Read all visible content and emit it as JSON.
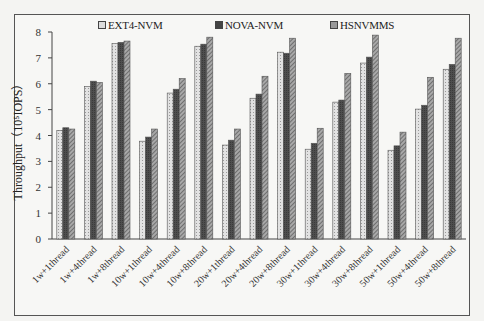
{
  "chart_data": {
    "type": "bar",
    "title": "",
    "xlabel": "",
    "ylabel": "Throughput（10⁵IOPS）",
    "ylim": [
      0,
      8
    ],
    "yticks": [
      0,
      1,
      2,
      3,
      4,
      5,
      6,
      7,
      8
    ],
    "grid": false,
    "legend_position": "top",
    "categories": [
      "1w+1thread",
      "1w+4thread",
      "1w+8thread",
      "10w+1thread",
      "10w+4thread",
      "10w+8thread",
      "20w+1thread",
      "20w+4thread",
      "20w+8thread",
      "30w+1thread",
      "30w+4thread",
      "30w+8thread",
      "50w+1thread",
      "50w+4thread",
      "50w+8thread"
    ],
    "series": [
      {
        "name": "EXT4-NVM",
        "color": "#d8d8d8",
        "values": [
          4.2,
          5.9,
          7.55,
          3.78,
          5.64,
          7.45,
          3.63,
          5.44,
          7.22,
          3.47,
          5.29,
          6.8,
          3.43,
          5.02,
          6.56
        ]
      },
      {
        "name": "NOVA-NVM",
        "color": "#4a4a4a",
        "values": [
          4.3,
          6.1,
          7.6,
          3.94,
          5.79,
          7.53,
          3.82,
          5.6,
          7.18,
          3.7,
          5.37,
          7.03,
          3.6,
          5.17,
          6.75
        ]
      },
      {
        "name": "HSNVMMS",
        "color": "#9a9a9a",
        "values": [
          4.25,
          6.05,
          7.65,
          4.25,
          6.2,
          7.8,
          4.25,
          6.29,
          7.76,
          4.28,
          6.4,
          7.88,
          4.13,
          6.25,
          7.76
        ]
      }
    ]
  },
  "legend": {
    "items": [
      {
        "label": "EXT4-NVM",
        "x": 98
      },
      {
        "label": "NOVA-NVM",
        "x": 215
      },
      {
        "label": "HSNVMMS",
        "x": 330
      }
    ]
  },
  "axis": {
    "ylabel": "Throughput（10⁵IOPS）"
  }
}
